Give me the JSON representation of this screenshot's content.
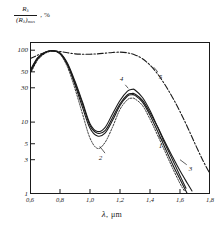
{
  "chart_data": {
    "type": "line",
    "title": "",
    "ylabel_numerator": "R",
    "ylabel_numerator_sub": "λ",
    "ylabel_denominator": "(R",
    "ylabel_denominator_sub": "λ",
    "ylabel_denominator_close": ")",
    "ylabel_denominator_max": "max",
    "ylabel_units": ", %",
    "xlabel": "λ",
    "xlabel_unit": ", μm",
    "xscale": "linear",
    "yscale": "log",
    "xlim": [
      0.6,
      1.8
    ],
    "ylim": [
      1,
      130
    ],
    "grid": false,
    "legend": "inline-curve-numbers",
    "xticks": [
      0.6,
      0.8,
      1.0,
      1.2,
      1.4,
      1.6,
      1.8
    ],
    "xticklabels": [
      "0,6",
      "0,8",
      "1,0",
      "1,2",
      "1,4",
      "1,6",
      "1,8"
    ],
    "yticks": [
      1,
      3,
      5,
      10,
      30,
      50,
      100
    ],
    "yticklabels": [
      "1",
      "3",
      "5",
      "10",
      "30",
      "50",
      "100"
    ],
    "series": [
      {
        "name": "1",
        "label": "1",
        "style": "solid",
        "label_x": 1.47,
        "label_y": 4.6,
        "x": [
          0.6,
          0.65,
          0.7,
          0.75,
          0.8,
          0.85,
          0.9,
          0.95,
          1.0,
          1.05,
          1.1,
          1.15,
          1.2,
          1.25,
          1.28,
          1.3,
          1.35,
          1.4,
          1.45,
          1.5,
          1.55,
          1.6,
          1.63,
          1.65
        ],
        "y": [
          48,
          75,
          92,
          98,
          90,
          62,
          33,
          16,
          8.2,
          6.4,
          7.0,
          10.5,
          17,
          23,
          24,
          23.5,
          19,
          12.5,
          7.5,
          4.4,
          2.6,
          1.6,
          1.2,
          1.0
        ]
      },
      {
        "name": "2",
        "label": "2",
        "style": "dotted",
        "label_x": 1.07,
        "label_y": 3.2,
        "x": [
          0.6,
          0.65,
          0.7,
          0.75,
          0.8,
          0.85,
          0.9,
          0.95,
          1.0,
          1.05,
          1.1,
          1.15,
          1.2,
          1.25,
          1.28,
          1.3,
          1.35,
          1.4,
          1.45,
          1.5,
          1.55,
          1.6,
          1.63
        ],
        "y": [
          46,
          72,
          90,
          97,
          88,
          58,
          29,
          13,
          6.0,
          4.3,
          5.2,
          8.5,
          15,
          20.5,
          21.5,
          21,
          17,
          11,
          6.6,
          3.9,
          2.3,
          1.4,
          1.1
        ]
      },
      {
        "name": "3",
        "label": "3",
        "style": "solid",
        "label_x": 1.67,
        "label_y": 2.2,
        "x": [
          0.6,
          0.65,
          0.7,
          0.75,
          0.8,
          0.85,
          0.9,
          0.95,
          1.0,
          1.05,
          1.1,
          1.15,
          1.2,
          1.25,
          1.28,
          1.3,
          1.35,
          1.4,
          1.45,
          1.5,
          1.55,
          1.6,
          1.65,
          1.68
        ],
        "y": [
          50,
          77,
          93,
          98,
          91,
          64,
          35,
          18,
          9.0,
          7.0,
          7.6,
          11.5,
          18,
          24,
          25,
          24.5,
          20,
          13.5,
          8.6,
          5.3,
          3.3,
          2.1,
          1.4,
          1.1
        ]
      },
      {
        "name": "4",
        "label": "4",
        "style": "solid",
        "label_x": 1.21,
        "label_y": 40,
        "x": [
          0.6,
          0.65,
          0.7,
          0.75,
          0.8,
          0.85,
          0.9,
          0.95,
          1.0,
          1.05,
          1.1,
          1.15,
          1.2,
          1.25,
          1.28,
          1.3,
          1.35,
          1.4,
          1.45,
          1.5,
          1.55,
          1.6,
          1.64
        ],
        "y": [
          52,
          78,
          94,
          99,
          92,
          66,
          37,
          19,
          9.5,
          7.4,
          8.4,
          13,
          20,
          27,
          28.5,
          28,
          22,
          14.5,
          8.6,
          5.0,
          3.0,
          1.8,
          1.2
        ]
      },
      {
        "name": "5",
        "label": "5",
        "style": "dash-dot",
        "label_x": 1.47,
        "label_y": 43,
        "x": [
          0.6,
          0.65,
          0.7,
          0.75,
          0.8,
          0.85,
          0.9,
          0.95,
          1.0,
          1.05,
          1.1,
          1.15,
          1.2,
          1.25,
          1.3,
          1.35,
          1.4,
          1.45,
          1.5,
          1.55,
          1.6,
          1.65,
          1.7,
          1.75,
          1.8
        ],
        "y": [
          76,
          85,
          93,
          97,
          96,
          92,
          89,
          88,
          88,
          89,
          91,
          93,
          94,
          92,
          86,
          76,
          62,
          47,
          33,
          22,
          14,
          8.5,
          5.0,
          3.0,
          1.9
        ]
      }
    ]
  },
  "colors": {
    "ink": "#1a1a1a",
    "background": "#ffffff"
  }
}
